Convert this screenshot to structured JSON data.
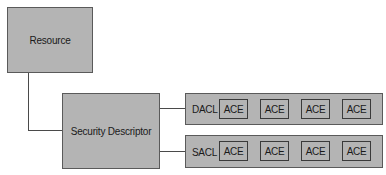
{
  "diagram": {
    "resource": {
      "label": "Resource"
    },
    "security_descriptor": {
      "label": "Security Descriptor"
    },
    "acls": [
      {
        "label": "DACL",
        "entries": [
          "ACE",
          "ACE",
          "ACE",
          "ACE"
        ]
      },
      {
        "label": "SACL",
        "entries": [
          "ACE",
          "ACE",
          "ACE",
          "ACE"
        ]
      }
    ],
    "colors": {
      "box_fill": "#b4b4b4",
      "border": "#5a5a5a",
      "line": "#4a4a4a",
      "background": "#ffffff"
    }
  }
}
